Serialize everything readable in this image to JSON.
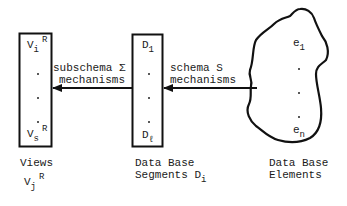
{
  "views_box": {
    "top_item": {
      "base": "V",
      "sub": "i",
      "sup": "R"
    },
    "bottom_item": {
      "base": "V",
      "sub": "s",
      "sup": "R"
    }
  },
  "segments_box": {
    "top_item": {
      "base": "D",
      "sub": "1"
    },
    "bottom_item": {
      "base": "D",
      "sub": "ℓ"
    }
  },
  "elements_blob": {
    "top_item": {
      "base": "e",
      "sub": "1"
    },
    "bottom_item": {
      "base": "e",
      "sub": "n"
    }
  },
  "arrows": {
    "subschema": {
      "line1": "subschema Σ",
      "line2": "mechanisms"
    },
    "schema": {
      "line1": "schema S",
      "line2": "mechanisms"
    }
  },
  "captions": {
    "views": {
      "line1": "Views",
      "sym": {
        "base": "V",
        "sub": "j",
        "sup": "R"
      }
    },
    "segments": {
      "line1": "Data Base",
      "line2": "Segments D",
      "sub": "i"
    },
    "elements": {
      "line1": "Data Base",
      "line2": "Elements"
    }
  },
  "colors": {
    "stroke": "#111111",
    "background": "#ffffff"
  }
}
